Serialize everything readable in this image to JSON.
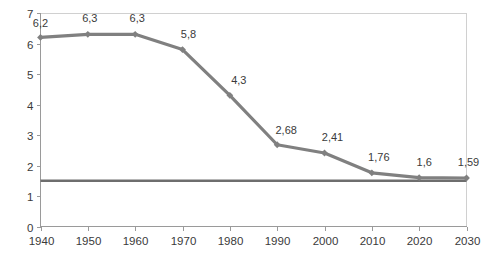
{
  "chart_data": {
    "type": "line",
    "title": "",
    "subtitle": "",
    "xlabel": "",
    "ylabel": "",
    "x": [
      1940,
      1950,
      1960,
      1970,
      1980,
      1990,
      2000,
      2010,
      2020,
      2030
    ],
    "categories": [
      "1940",
      "1950",
      "1960",
      "1970",
      "1980",
      "1990",
      "2000",
      "2010",
      "2020",
      "2030"
    ],
    "values": [
      6.2,
      6.3,
      6.3,
      5.8,
      4.3,
      2.68,
      2.41,
      1.76,
      1.6,
      1.59
    ],
    "point_labels": [
      "6,2",
      "6,3",
      "6,3",
      "5,8",
      "4,3",
      "2,68",
      "2,41",
      "1,76",
      "1,6",
      "1,59"
    ],
    "series": [
      {
        "name": "main-series",
        "values": [
          6.2,
          6.3,
          6.3,
          5.8,
          4.3,
          2.68,
          2.41,
          1.76,
          1.6,
          1.59
        ],
        "color": "#808080",
        "marker": "diamond"
      },
      {
        "name": "reference-line",
        "values": [
          1.5,
          1.5,
          1.5,
          1.5,
          1.5,
          1.5,
          1.5,
          1.5,
          1.5,
          1.5
        ],
        "color": "#6e6e6e",
        "marker": "none"
      }
    ],
    "reference_line_value": 1.5,
    "xlim": [
      1940,
      2030
    ],
    "ylim": [
      0,
      7
    ],
    "y_ticks": [
      0,
      1,
      2,
      3,
      4,
      5,
      6,
      7
    ],
    "y_tick_labels": [
      "0",
      "1",
      "2",
      "3",
      "4",
      "5",
      "6",
      "7"
    ],
    "x_ticks": [
      1940,
      1950,
      1960,
      1970,
      1980,
      1990,
      2000,
      2010,
      2020,
      2030
    ],
    "x_tick_labels": [
      "1940",
      "1950",
      "1960",
      "1970",
      "1980",
      "1990",
      "2000",
      "2010",
      "2020",
      "2030"
    ],
    "grid": false,
    "legend": "none",
    "decimal_separator": ",",
    "colors": {
      "series": "#808080",
      "reference": "#6e6e6e",
      "axis": "#9a9a9a",
      "frame": "#d0d0d0",
      "text": "#3a3a3a",
      "background": "#ffffff"
    }
  }
}
